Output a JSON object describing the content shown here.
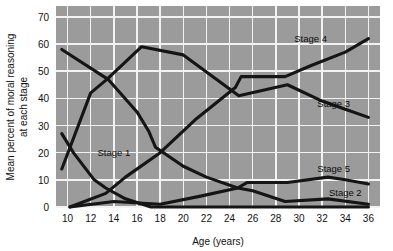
{
  "figure": {
    "background_color": "#ffffff",
    "plot_background_color": "#9b9b9b",
    "gridline_color": "#f2f2f2",
    "line_color": "#151515"
  },
  "axes": {
    "x_title": "Age (years)",
    "y_title_line1": "Mean percent of moral reasoning",
    "y_title_line2": "at each stage",
    "x_ticks": [
      "10",
      "12",
      "14",
      "16",
      "18",
      "20",
      "22",
      "24",
      "26",
      "28",
      "30",
      "32",
      "34",
      "36"
    ],
    "y_ticks": [
      "0",
      "10",
      "20",
      "30",
      "40",
      "50",
      "60",
      "70"
    ]
  },
  "labels": {
    "stage1": "Stage 1",
    "stage2": "Stage 2",
    "stage3": "Stage 3",
    "stage4": "Stage 4",
    "stage5": "Stage 5"
  },
  "chart_data": {
    "type": "line",
    "title": "",
    "xlabel": "Age (years)",
    "ylabel": "Mean percent of moral reasoning at each stage",
    "xlim": [
      9,
      37
    ],
    "ylim": [
      0,
      74
    ],
    "x_ticks": [
      10,
      12,
      14,
      16,
      18,
      20,
      22,
      24,
      26,
      28,
      30,
      32,
      34,
      36
    ],
    "y_ticks": [
      0,
      10,
      20,
      30,
      40,
      50,
      60,
      70
    ],
    "grid": true,
    "legend": "inline-labels",
    "series": [
      {
        "name": "Stage 1",
        "label_position": {
          "x": 14.0,
          "y": 20
        },
        "points": [
          {
            "x": 9.5,
            "y": 27
          },
          {
            "x": 10.5,
            "y": 20
          },
          {
            "x": 12.3,
            "y": 10
          },
          {
            "x": 13.3,
            "y": 7
          },
          {
            "x": 15.0,
            "y": 3
          },
          {
            "x": 17.2,
            "y": 0
          },
          {
            "x": 36.0,
            "y": 0
          }
        ]
      },
      {
        "name": "Stage 2",
        "label_position": {
          "x": 34.0,
          "y": 5
        },
        "points": [
          {
            "x": 9.5,
            "y": 58
          },
          {
            "x": 13.5,
            "y": 47
          },
          {
            "x": 16.0,
            "y": 35
          },
          {
            "x": 17.0,
            "y": 28
          },
          {
            "x": 17.6,
            "y": 22
          },
          {
            "x": 20.0,
            "y": 15
          },
          {
            "x": 22.0,
            "y": 11
          },
          {
            "x": 24.7,
            "y": 7
          },
          {
            "x": 26.0,
            "y": 6
          },
          {
            "x": 28.8,
            "y": 2
          },
          {
            "x": 32.5,
            "y": 3
          },
          {
            "x": 36.0,
            "y": 1
          }
        ]
      },
      {
        "name": "Stage 3",
        "label_position": {
          "x": 33.0,
          "y": 38
        },
        "points": [
          {
            "x": 9.5,
            "y": 14
          },
          {
            "x": 12.0,
            "y": 42
          },
          {
            "x": 13.4,
            "y": 47
          },
          {
            "x": 16.4,
            "y": 59
          },
          {
            "x": 20.0,
            "y": 56
          },
          {
            "x": 24.8,
            "y": 41
          },
          {
            "x": 29.0,
            "y": 45
          },
          {
            "x": 32.0,
            "y": 39
          },
          {
            "x": 34.0,
            "y": 36
          },
          {
            "x": 36.0,
            "y": 33
          }
        ]
      },
      {
        "name": "Stage 4",
        "label_position": {
          "x": 31.0,
          "y": 62
        },
        "points": [
          {
            "x": 10.2,
            "y": 0
          },
          {
            "x": 13.3,
            "y": 5
          },
          {
            "x": 15.0,
            "y": 11
          },
          {
            "x": 18.0,
            "y": 20
          },
          {
            "x": 21.0,
            "y": 32
          },
          {
            "x": 24.5,
            "y": 44
          },
          {
            "x": 25.0,
            "y": 48
          },
          {
            "x": 28.8,
            "y": 48
          },
          {
            "x": 31.0,
            "y": 52
          },
          {
            "x": 34.0,
            "y": 57
          },
          {
            "x": 36.0,
            "y": 62
          }
        ]
      },
      {
        "name": "Stage 5",
        "label_position": {
          "x": 33.0,
          "y": 14
        },
        "points": [
          {
            "x": 10.2,
            "y": 0
          },
          {
            "x": 14.0,
            "y": 2
          },
          {
            "x": 18.0,
            "y": 1
          },
          {
            "x": 21.5,
            "y": 4
          },
          {
            "x": 24.7,
            "y": 7
          },
          {
            "x": 25.5,
            "y": 9
          },
          {
            "x": 29.0,
            "y": 9
          },
          {
            "x": 32.5,
            "y": 11
          },
          {
            "x": 34.0,
            "y": 10
          },
          {
            "x": 36.0,
            "y": 8.5
          }
        ]
      }
    ]
  }
}
